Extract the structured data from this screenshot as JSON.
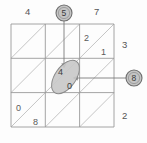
{
  "figure": {
    "type": "grid-diagram",
    "grid": {
      "rows": 3,
      "cols": 3,
      "diagonal_direction": "bottom-left-to-top-right"
    },
    "outer_labels": [
      {
        "id": "top-left",
        "value": "4"
      },
      {
        "id": "top-right",
        "value": "7"
      },
      {
        "id": "right-upper",
        "value": "3"
      },
      {
        "id": "right-lower",
        "value": "2"
      }
    ],
    "cell_labels": [
      {
        "id": "cell-r0c2-upper",
        "value": "2"
      },
      {
        "id": "cell-r0c2-lower",
        "value": "1"
      },
      {
        "id": "cell-r2c0-upper",
        "value": "0"
      },
      {
        "id": "cell-r2c0-lower",
        "value": "8"
      }
    ],
    "highlight_ellipse": {
      "fill": "#c9c9c9",
      "stroke": "#8a8a8a",
      "values": [
        {
          "id": "ellipse-value-upper",
          "value": "4"
        },
        {
          "id": "ellipse-value-lower",
          "value": "0"
        }
      ]
    },
    "callouts": [
      {
        "id": "callout-top",
        "value": "5",
        "fill": "#c4c4c4",
        "stroke": "#6e6e6e"
      },
      {
        "id": "callout-right",
        "value": "8",
        "fill": "#c4c4c4",
        "stroke": "#6e6e6e"
      }
    ],
    "colors": {
      "grid_line": "#9a9a9a",
      "diagonal_line": "#b4b4b4",
      "leader_line": "#7a7a7a",
      "text": "#4a4a4a",
      "background": "#fdfdfd"
    }
  }
}
